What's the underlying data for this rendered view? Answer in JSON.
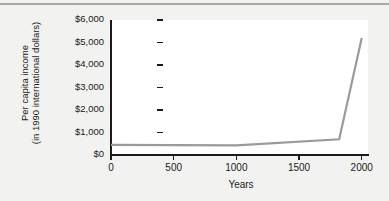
{
  "chart_data": {
    "type": "line",
    "title": "",
    "xlabel": "Years",
    "ylabel_line1": "Per capita income",
    "ylabel_line2": "(in 1990 international dollars)",
    "x": [
      0,
      1000,
      1820,
      2000
    ],
    "values": [
      450,
      425,
      700,
      5200
    ],
    "series": [
      {
        "name": "Per capita income",
        "x": [
          0,
          1000,
          1820,
          2000
        ],
        "values": [
          450,
          425,
          700,
          5200
        ],
        "color": "#9a9a9a"
      }
    ],
    "xlim": [
      0,
      2050
    ],
    "ylim": [
      0,
      6000
    ],
    "xticks": [
      0,
      500,
      1000,
      1500,
      2000
    ],
    "xtick_labels": [
      "0",
      "500",
      "1000",
      "1500",
      "2000"
    ],
    "yticks": [
      0,
      1000,
      2000,
      3000,
      4000,
      5000,
      6000
    ],
    "ytick_labels": [
      "$0",
      "$1,000",
      "$2,000",
      "$3,000",
      "$4,000",
      "$5,000",
      "$6,000"
    ],
    "grid": false,
    "legend": "none",
    "plot_background": "#ffffff",
    "figure_background": "#f2f2f0",
    "axis_color": "#1a1a1a"
  }
}
